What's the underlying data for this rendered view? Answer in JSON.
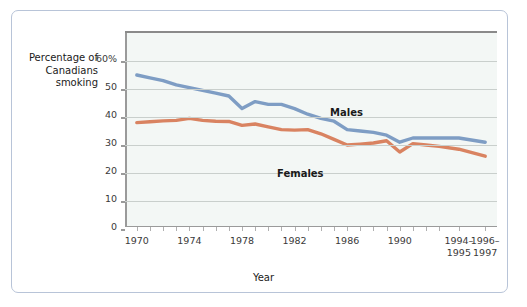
{
  "chart_data": {
    "type": "line",
    "title": "",
    "xlabel": "Year",
    "ylabel": "Percentage of\nCanadians\nsmoking",
    "ylabel_lines": [
      "Percentage of",
      "Canadians",
      "smoking"
    ],
    "ytick_labels": [
      "0",
      "10",
      "20",
      "30",
      "40",
      "50",
      "60%"
    ],
    "ytick_values": [
      0,
      10,
      20,
      30,
      40,
      50,
      60
    ],
    "ylim": [
      0,
      70
    ],
    "grid": true,
    "legend_position": "inline-annotations",
    "xtick_labels": [
      "1970",
      "1974",
      "1978",
      "1982",
      "1986",
      "1990",
      "1994–\n1995",
      "1996–\n1997"
    ],
    "xtick_values": [
      1970,
      1974,
      1978,
      1982,
      1986,
      1990,
      1994.5,
      1996.5
    ],
    "x": [
      1970,
      1971,
      1972,
      1973,
      1974,
      1975,
      1976,
      1977,
      1978,
      1979,
      1980,
      1981,
      1982,
      1983,
      1984,
      1985,
      1986,
      1987,
      1988,
      1989,
      1990,
      1991,
      1992,
      1993,
      1994.5,
      1996.5
    ],
    "series": [
      {
        "name": "Males",
        "color": "#7e9dc4",
        "values": [
          55.0,
          54.0,
          53.0,
          51.5,
          50.5,
          49.5,
          48.5,
          47.5,
          43.0,
          45.5,
          44.5,
          44.5,
          43.0,
          41.0,
          39.5,
          38.5,
          35.5,
          35.0,
          34.5,
          33.5,
          31.0,
          32.5,
          32.5,
          32.5,
          32.5,
          31.0
        ]
      },
      {
        "name": "Females",
        "color": "#d98361",
        "values": [
          38.0,
          38.3,
          38.6,
          38.8,
          39.5,
          38.8,
          38.5,
          38.4,
          37.0,
          37.5,
          36.5,
          35.5,
          35.3,
          35.5,
          34.0,
          32.0,
          30.0,
          30.3,
          30.7,
          31.5,
          27.5,
          30.5,
          30.0,
          29.5,
          28.5,
          26.0
        ]
      }
    ]
  },
  "annotations": [
    {
      "name": "males-label",
      "text": "Males"
    },
    {
      "name": "females-label",
      "text": "Females"
    }
  ]
}
